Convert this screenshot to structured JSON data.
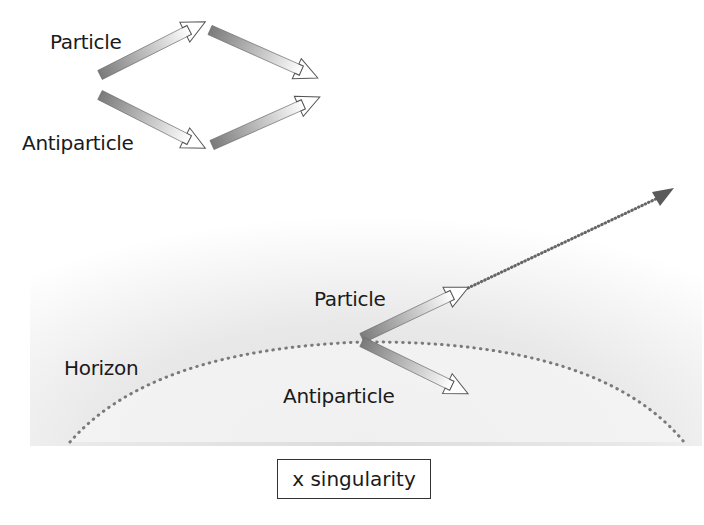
{
  "diagram": {
    "top_panel": {
      "labels": {
        "particle": "Particle",
        "antiparticle": "Antiparticle"
      },
      "description": "Virtual particle and antiparticle pair separate and recombine (annihilate)"
    },
    "bottom_panel": {
      "labels": {
        "particle": "Particle",
        "antiparticle": "Antiparticle",
        "horizon": "Horizon",
        "singularity": "x singularity"
      },
      "description": "Pair created at event horizon; antiparticle falls in, particle escapes along dotted path"
    },
    "colors": {
      "arrow_dark": "#7a7a7a",
      "arrow_light": "#ffffff",
      "arrow_outline": "#666666",
      "dotted_line": "#777777",
      "escape_arrowhead": "#5a5a5a",
      "field_gradient": "#e6e6e6",
      "text": "#1a1a1a"
    }
  }
}
